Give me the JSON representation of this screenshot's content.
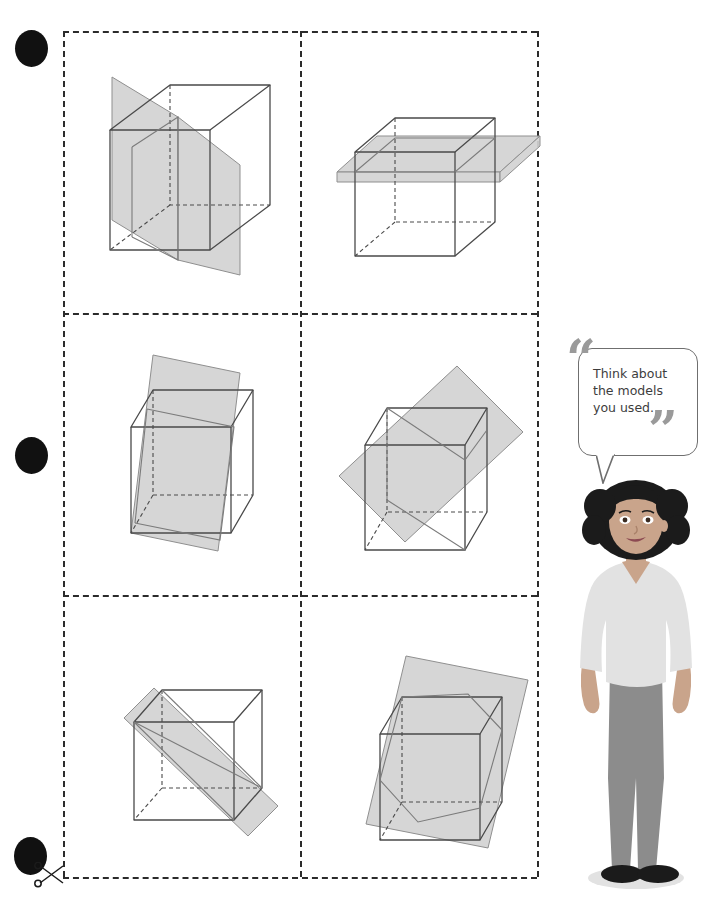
{
  "page": {
    "background_color": "#ffffff"
  },
  "cut_grid": {
    "name": "cut-out-grid",
    "rows": 3,
    "cols": 2,
    "border_style": "dashed",
    "border_color": "#2b2b2b"
  },
  "hole_punches": {
    "count": 3,
    "color": "#111111",
    "labels": [
      "hole-punch-top",
      "hole-punch-middle",
      "hole-punch-bottom"
    ]
  },
  "scissors": {
    "icon": "scissors-icon",
    "meaning": "cut along dashed line"
  },
  "speech_bubble": {
    "text": "Think about\nthe models\nyou used.",
    "quote_open": "“",
    "quote_close": "”",
    "quote_color": "#9a9a9a",
    "border_color": "#6f6f6f"
  },
  "person": {
    "name": "student-character",
    "hair_color": "#1b1b1b",
    "skin_color": "#c9a48b",
    "top_color": "#e2e2e2",
    "pants_color": "#8c8c8c",
    "shoe_color": "#1b1b1b"
  },
  "figures": [
    {
      "id": "figure-1",
      "label": "Cube with vertical plane through two opposite edges",
      "cross_section": "rectangle",
      "plane_color": "#d2d2d2",
      "cube_edge_color": "#4a4a4a"
    },
    {
      "id": "figure-2",
      "label": "Cube with horizontal plane parallel to the base",
      "cross_section": "square",
      "plane_color": "#d2d2d2",
      "cube_edge_color": "#4a4a4a"
    },
    {
      "id": "figure-3",
      "label": "Cube with tilted vertical plane",
      "cross_section": "rectangle",
      "plane_color": "#d2d2d2",
      "cube_edge_color": "#4a4a4a"
    },
    {
      "id": "figure-4",
      "label": "Cube with rotated oblique plane through opposite edges",
      "cross_section": "rectangle",
      "plane_color": "#d2d2d2",
      "cube_edge_color": "#4a4a4a"
    },
    {
      "id": "figure-5",
      "label": "Cube with narrow diagonal plane band",
      "cross_section": "rectangle",
      "plane_color": "#d2d2d2",
      "cube_edge_color": "#4a4a4a"
    },
    {
      "id": "figure-6",
      "label": "Cube with oblique plane giving a hexagonal cross-section",
      "cross_section": "hexagon",
      "plane_color": "#d2d2d2",
      "cube_edge_color": "#4a4a4a"
    }
  ]
}
